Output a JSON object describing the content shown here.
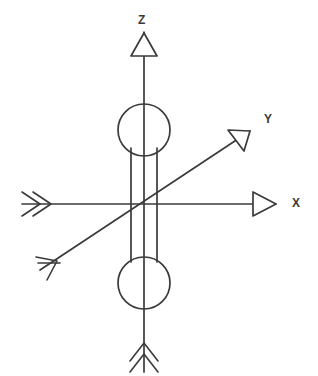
{
  "figure": {
    "kind": "line-drawing",
    "background_color": "#ffffff",
    "ink_color": "#3a3a3a",
    "width": 318,
    "height": 376
  },
  "origin": {
    "x": 144,
    "y": 204
  },
  "axes": [
    {
      "id": "z",
      "label": "Z",
      "label_x": 138,
      "label_y": 14,
      "orientation": "vertical",
      "positive_end": {
        "x": 144,
        "y": 32
      },
      "negative_end": {
        "x": 144,
        "y": 372
      },
      "positive_tip_marker": "open-triangle-arrowhead",
      "negative_tip_marker": "double-chevron-fletching"
    },
    {
      "id": "x",
      "label": "X",
      "label_x": 292,
      "label_y": 197,
      "orientation": "horizontal",
      "positive_end": {
        "x": 276,
        "y": 204
      },
      "negative_end": {
        "x": 22,
        "y": 204
      },
      "positive_tip_marker": "open-triangle-arrowhead",
      "negative_tip_marker": "double-chevron-fletching"
    },
    {
      "id": "y",
      "label": "Y",
      "label_x": 264,
      "label_y": 113,
      "orientation": "diagonal",
      "positive_end": {
        "x": 250,
        "y": 131
      },
      "negative_end": {
        "x": 40,
        "y": 270
      },
      "positive_tip_marker": "open-triangle-arrowhead",
      "negative_tip_marker": "barbed-fletching"
    }
  ],
  "body": {
    "name": "cylindrical-rotor",
    "top_circle": {
      "cx": 144,
      "cy": 130,
      "r": 26
    },
    "bottom_circle": {
      "cx": 144,
      "cy": 283,
      "r": 26
    },
    "barrel": {
      "left_x": 131,
      "right_x": 157,
      "top_y": 148,
      "bottom_y": 262
    }
  }
}
